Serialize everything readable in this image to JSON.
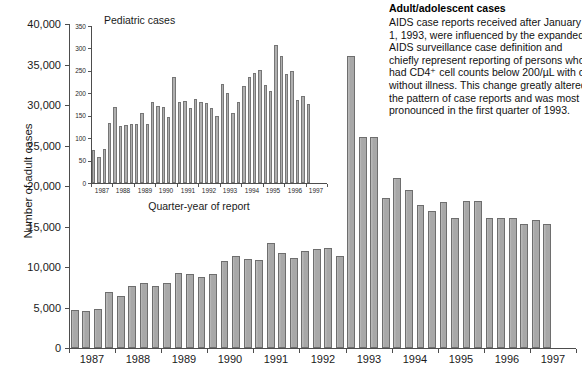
{
  "annotation": {
    "title": "Adult/adolescent cases",
    "lines": [
      "AIDS case reports received after January",
      "1, 1993, were influenced by the expanded",
      "AIDS surveillance case definition and",
      "chiefly represent reporting of persons who",
      "had CD4⁺ cell counts below 200/µL with or",
      "without illness. This change greatly altered",
      "the pattern of case reports and was most",
      "pronounced in the first quarter of 1993."
    ]
  },
  "chart_data": [
    {
      "type": "bar",
      "id": "main",
      "title": "",
      "xlabel": "",
      "ylabel": "Number of adult cases",
      "ylim": [
        0,
        40000
      ],
      "yticks": [
        0,
        5000,
        10000,
        15000,
        20000,
        25000,
        30000,
        35000,
        40000
      ],
      "ytick_labels": [
        "0",
        "5,000",
        "10,000",
        "15,000",
        "20,000",
        "25,000",
        "30,000",
        "35,000",
        "40,000"
      ],
      "grid": false,
      "year_labels": [
        "1987",
        "1988",
        "1989",
        "1990",
        "1991",
        "1992",
        "1993",
        "1994",
        "1995",
        "1996",
        "1997"
      ],
      "categories": [
        "1987 Q1",
        "1987 Q2",
        "1987 Q3",
        "1987 Q4",
        "1988 Q1",
        "1988 Q2",
        "1988 Q3",
        "1988 Q4",
        "1989 Q1",
        "1989 Q2",
        "1989 Q3",
        "1989 Q4",
        "1990 Q1",
        "1990 Q2",
        "1990 Q3",
        "1990 Q4",
        "1991 Q1",
        "1991 Q2",
        "1991 Q3",
        "1991 Q4",
        "1992 Q1",
        "1992 Q2",
        "1992 Q3",
        "1992 Q4",
        "1993 Q1",
        "1993 Q2",
        "1993 Q3",
        "1993 Q4",
        "1994 Q1",
        "1994 Q2",
        "1994 Q3",
        "1994 Q4",
        "1995 Q1",
        "1995 Q2",
        "1995 Q3",
        "1995 Q4",
        "1996 Q1",
        "1996 Q2",
        "1996 Q3",
        "1996 Q4",
        "1997 Q1",
        "1997 Q2",
        "1997 Q3",
        "1997 Q4"
      ],
      "values": [
        4700,
        4600,
        4800,
        6900,
        6400,
        7600,
        8000,
        7700,
        8000,
        9200,
        9100,
        8800,
        9100,
        10800,
        11400,
        11000,
        10900,
        13000,
        11700,
        11100,
        12000,
        12200,
        12400,
        11400,
        36000,
        26100,
        26100,
        18500,
        21000,
        19500,
        17700,
        16900,
        18000,
        16100,
        18100,
        18200,
        16000,
        16000,
        16000,
        15300,
        15800,
        15300,
        0,
        0
      ]
    },
    {
      "type": "bar",
      "id": "inset",
      "title": "Pediatric cases",
      "xlabel": "Quarter-year of report",
      "ylabel": "",
      "ylim": [
        0,
        350
      ],
      "yticks": [
        0,
        50,
        100,
        150,
        200,
        250,
        300,
        350
      ],
      "ytick_labels": [
        "0",
        "50",
        "100",
        "150",
        "200",
        "250",
        "300",
        "350"
      ],
      "grid": false,
      "year_labels": [
        "1987",
        "1988",
        "1989",
        "1990",
        "1991",
        "1992",
        "1993",
        "1994",
        "1995",
        "1996",
        "1997"
      ],
      "categories": [
        "1987 Q1",
        "1987 Q2",
        "1987 Q3",
        "1987 Q4",
        "1988 Q1",
        "1988 Q2",
        "1988 Q3",
        "1988 Q4",
        "1989 Q1",
        "1989 Q2",
        "1989 Q3",
        "1989 Q4",
        "1990 Q1",
        "1990 Q2",
        "1990 Q3",
        "1990 Q4",
        "1991 Q1",
        "1991 Q2",
        "1991 Q3",
        "1991 Q4",
        "1992 Q1",
        "1992 Q2",
        "1992 Q3",
        "1992 Q4",
        "1993 Q1",
        "1993 Q2",
        "1993 Q3",
        "1993 Q4",
        "1994 Q1",
        "1994 Q2",
        "1994 Q3",
        "1994 Q4",
        "1995 Q1",
        "1995 Q2",
        "1995 Q3",
        "1995 Q4",
        "1996 Q1",
        "1996 Q2",
        "1996 Q3",
        "1996 Q4",
        "1997 Q1",
        "1997 Q2",
        "1997 Q3",
        "1997 Q4"
      ],
      "values": [
        73,
        57,
        75,
        133,
        170,
        128,
        130,
        131,
        131,
        156,
        132,
        180,
        172,
        169,
        148,
        236,
        180,
        182,
        167,
        187,
        181,
        179,
        168,
        150,
        221,
        201,
        156,
        180,
        217,
        237,
        245,
        251,
        219,
        205,
        308,
        284,
        244,
        250,
        185,
        193,
        176,
        0,
        0,
        0
      ]
    }
  ]
}
